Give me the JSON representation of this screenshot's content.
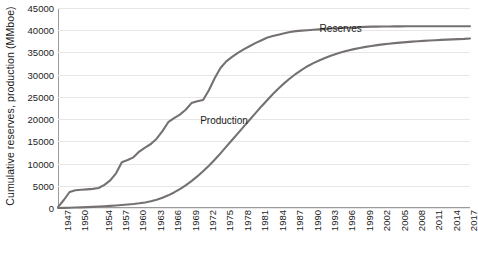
{
  "chart_data": {
    "type": "line",
    "title": "",
    "xlabel": "",
    "ylabel": "Cumulative reserves, production (MMboe)",
    "ylim": [
      0,
      45000
    ],
    "ytick_labels": [
      "0",
      "5000",
      "10000",
      "15000",
      "20000",
      "25000",
      "30000",
      "35000",
      "40000",
      "45000"
    ],
    "ytick_values": [
      0,
      5000,
      10000,
      15000,
      20000,
      25000,
      30000,
      35000,
      40000,
      45000
    ],
    "xtick_labels": [
      "1947",
      "1950",
      "1954",
      "1957",
      "1960",
      "1963",
      "1966",
      "1969",
      "1972",
      "1975",
      "1978",
      "1981",
      "1984",
      "1987",
      "1990",
      "1993",
      "1996",
      "1999",
      "2002",
      "2005",
      "2008",
      "2011",
      "2014",
      "2017"
    ],
    "xlim": [
      1947,
      2018
    ],
    "grid": "horizontal",
    "legend": "inline-annotations",
    "series_color": "#767171",
    "x": [
      1947,
      1948,
      1949,
      1950,
      1951,
      1952,
      1953,
      1954,
      1955,
      1956,
      1957,
      1958,
      1959,
      1960,
      1961,
      1962,
      1963,
      1964,
      1965,
      1966,
      1967,
      1968,
      1969,
      1970,
      1971,
      1972,
      1973,
      1974,
      1975,
      1976,
      1977,
      1978,
      1979,
      1980,
      1981,
      1982,
      1983,
      1984,
      1985,
      1986,
      1987,
      1988,
      1989,
      1990,
      1991,
      1992,
      1993,
      1994,
      1995,
      1996,
      1997,
      1998,
      1999,
      2000,
      2001,
      2002,
      2003,
      2004,
      2005,
      2006,
      2007,
      2008,
      2009,
      2010,
      2011,
      2012,
      2013,
      2014,
      2015,
      2016,
      2017,
      2018
    ],
    "series": [
      {
        "name": "Reserves",
        "values": [
          200,
          1800,
          3600,
          4000,
          4100,
          4200,
          4300,
          4500,
          5200,
          6200,
          7800,
          10300,
          10800,
          11400,
          12700,
          13600,
          14400,
          15600,
          17300,
          19300,
          20200,
          21000,
          22100,
          23600,
          24000,
          24300,
          26500,
          29200,
          31500,
          33000,
          34000,
          34900,
          35700,
          36400,
          37100,
          37700,
          38300,
          38700,
          39000,
          39300,
          39600,
          39800,
          39900,
          40000,
          40100,
          40200,
          40300,
          40400,
          40450,
          40500,
          40550,
          40600,
          40700,
          40750,
          40800,
          40820,
          40840,
          40850,
          40860,
          40870,
          40880,
          40890,
          40900,
          40900,
          40900,
          40900,
          40900,
          40900,
          40900,
          40900,
          40900,
          40900
        ],
        "annotation": "Reserves",
        "annotation_x_pct": 63.5,
        "annotation_y_pct": 7.5
      },
      {
        "name": "Production",
        "values": [
          10,
          30,
          60,
          100,
          150,
          200,
          260,
          330,
          400,
          480,
          570,
          670,
          780,
          900,
          1050,
          1250,
          1500,
          1850,
          2300,
          2850,
          3500,
          4250,
          5100,
          6050,
          7100,
          8250,
          9500,
          10850,
          12300,
          13800,
          15300,
          16800,
          18300,
          19800,
          21300,
          22800,
          24200,
          25600,
          26900,
          28100,
          29200,
          30200,
          31100,
          31900,
          32600,
          33200,
          33750,
          34250,
          34700,
          35100,
          35450,
          35750,
          36000,
          36250,
          36450,
          36650,
          36820,
          36970,
          37100,
          37220,
          37330,
          37430,
          37520,
          37600,
          37680,
          37750,
          37820,
          37880,
          37940,
          38000,
          38060,
          38150
        ],
        "annotation": "Production",
        "annotation_x_pct": 34.5,
        "annotation_y_pct": 53.5
      }
    ]
  }
}
